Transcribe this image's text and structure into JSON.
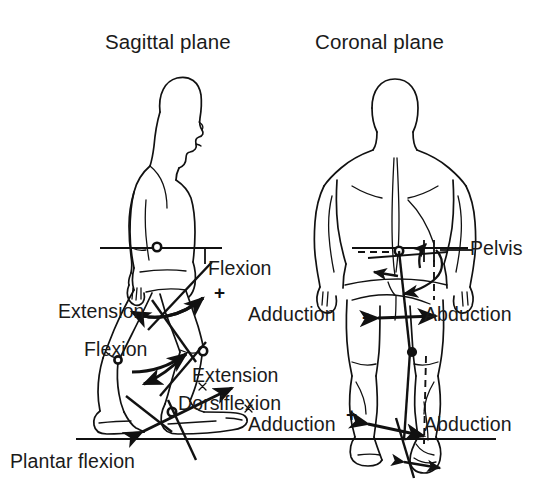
{
  "figure": {
    "background_color": "#ffffff",
    "ink_color": "#111111",
    "width": 553,
    "height": 504
  },
  "panels": [
    {
      "id": "sagittal",
      "title": "Sagittal plane",
      "view": "lateral-side-view",
      "labels": [
        {
          "key": "flexion_hip",
          "text": "Flexion",
          "sign": "+"
        },
        {
          "key": "extension_hip",
          "text": "Extension",
          "sign": ""
        },
        {
          "key": "flexion_knee",
          "text": "Flexion",
          "sign": ""
        },
        {
          "key": "extension_knee",
          "text": "Extension",
          "sign": "+"
        },
        {
          "key": "dorsiflexion",
          "text": "Dorsiflexion",
          "sign": "+"
        },
        {
          "key": "plantar_flexion",
          "text": "Plantar flexion",
          "sign": ""
        }
      ]
    },
    {
      "id": "coronal",
      "title": "Coronal plane",
      "view": "posterior-view",
      "labels": [
        {
          "key": "pelvis",
          "text": "Pelvis",
          "sign": ""
        },
        {
          "key": "adduction_hip",
          "text": "Adduction",
          "sign": "+"
        },
        {
          "key": "abduction_hip",
          "text": "Abduction",
          "sign": ""
        },
        {
          "key": "adduction_ankle",
          "text": "Adduction",
          "sign": "+"
        },
        {
          "key": "abduction_ankle",
          "text": "Abduction",
          "sign": ""
        }
      ]
    }
  ],
  "titles": {
    "sagittal": "Sagittal plane",
    "coronal": "Coronal plane"
  },
  "annotations": {
    "flexion_hip": "Flexion",
    "extension_hip": "Extension",
    "flexion_knee": "Flexion",
    "extension_knee": "Extension",
    "dorsiflexion": "Dorsiflexion",
    "plantar_flexion": "Plantar flexion",
    "pelvis": "Pelvis",
    "adduction_hip": "Adduction",
    "abduction_hip": "Abduction",
    "adduction_ankle": "Adduction",
    "abduction_ankle": "Abduction"
  },
  "signs": {
    "flexion_hip_plus": "+",
    "extension_knee_plus": "+",
    "dorsiflexion_plus": "+",
    "adduction_hip_plus": "+",
    "adduction_ankle_plus": "+"
  }
}
